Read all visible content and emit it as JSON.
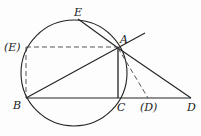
{
  "diagram": {
    "type": "geometry",
    "stroke_color": "#222222",
    "circle": {
      "cx": 74,
      "cy": 73,
      "r": 53
    },
    "points": {
      "A": {
        "x": 118,
        "y": 48,
        "label": "A",
        "lx": 122,
        "ly": 35
      },
      "B": {
        "x": 26,
        "y": 98,
        "label": "B",
        "lx": 13,
        "ly": 100
      },
      "C": {
        "x": 118,
        "y": 98,
        "label": "C",
        "lx": 118,
        "ly": 101
      },
      "D": {
        "x": 191,
        "y": 98,
        "label": "D",
        "lx": 188,
        "ly": 101
      },
      "D_alt": {
        "x": 148,
        "y": 98,
        "label": "(D)",
        "lx": 141,
        "ly": 101
      },
      "E": {
        "x": 78,
        "y": 19,
        "label": "E",
        "lx": 74,
        "ly": 7
      },
      "E_alt": {
        "x": 26,
        "y": 47,
        "label": "(E)",
        "lx": 6,
        "ly": 42
      }
    },
    "solid_segments": [
      [
        "B",
        "C"
      ],
      [
        "C",
        "D"
      ],
      [
        "B",
        "A"
      ],
      [
        "A",
        "C"
      ],
      [
        "E",
        "A"
      ],
      [
        "A",
        "D"
      ]
    ],
    "dashed_segments": [
      [
        "E_alt",
        "A"
      ],
      [
        "E_alt",
        "B"
      ],
      [
        "A",
        "D_alt"
      ]
    ],
    "ray_extension": {
      "from": "A",
      "to": {
        "x": 145,
        "y": 33
      }
    }
  }
}
